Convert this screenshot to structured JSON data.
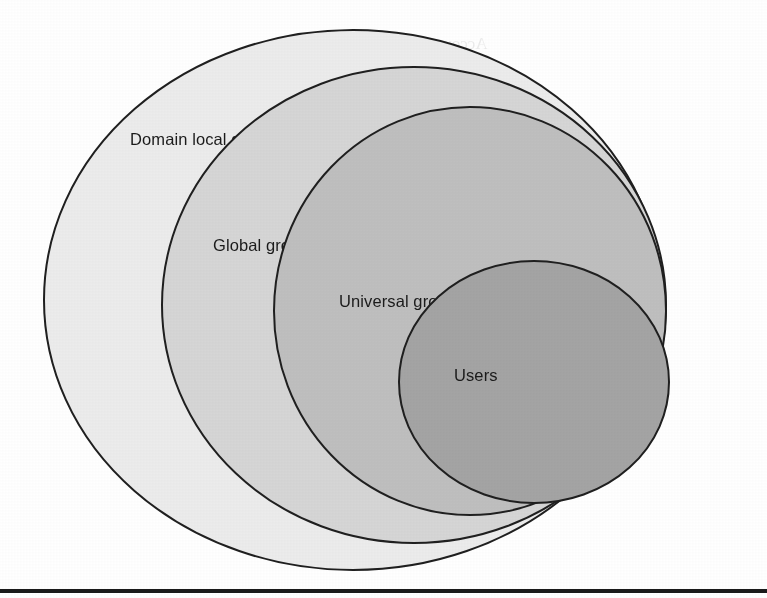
{
  "figure": {
    "kind": "nested-ellipse-venn-diagram",
    "background_color": "#ffffff",
    "outline_color": "#1f1f1f",
    "label_color": "#1b1b1b"
  },
  "regions": [
    {
      "id": "domain-local-group",
      "label": "Domain local group",
      "fill": "#ececec",
      "label_x": 130,
      "label_y": 145,
      "cx": 353,
      "cy": 300,
      "rx": 309,
      "ry": 270
    },
    {
      "id": "global-group",
      "label": "Global group",
      "fill": "#d6d6d6",
      "label_x": 213,
      "label_y": 251,
      "cx": 414,
      "cy": 305,
      "rx": 252,
      "ry": 238
    },
    {
      "id": "universal-group",
      "label": "Universal group",
      "fill": "#bfbfbf",
      "label_x": 339,
      "label_y": 307,
      "cx": 470,
      "cy": 311,
      "rx": 196,
      "ry": 204
    },
    {
      "id": "users",
      "label": "Users",
      "fill": "#a4a4a4",
      "label_x": 454,
      "label_y": 381,
      "cx": 534,
      "cy": 382,
      "rx": 135,
      "ry": 121
    }
  ],
  "bottom_rule": {
    "present": true,
    "color": "#1a1a1a",
    "y": 589
  },
  "ghost_text": {
    "note": "faint illegible show-through of text from the reverse side of the scanned page",
    "lines": [
      "Account",
      "Nothing and a solicity group",
      "Domain local the Universal the",
      "and group account also",
      "possible to add Universal to the domain local",
      "the Domain local groups and cannot add for the user",
      "accounts of member of the other domain",
      "the group scope can be also changed if",
      "the domain a domain and of a forest and then",
      "might be group can be change to a group as in",
      "the domain Domain to domain"
    ]
  }
}
